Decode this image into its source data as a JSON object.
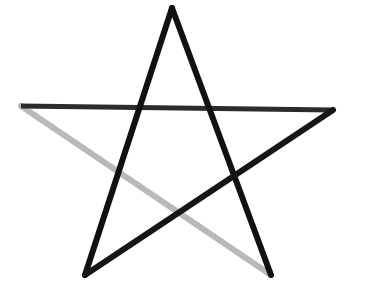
{
  "figure": {
    "name": "pentagram-star",
    "width": 365,
    "height": 296,
    "background_color": "#ffffff"
  },
  "chart_data": {
    "type": "line",
    "xlabel": "",
    "ylabel": "",
    "grid": false,
    "legend": "none",
    "xlim": [
      0,
      365
    ],
    "ylim": [
      296,
      0
    ],
    "coordinate_system": "pixels, origin top-left",
    "vertices": [
      {
        "id": "apex",
        "label": "top point",
        "x": 172,
        "y": 8
      },
      {
        "id": "right-point",
        "label": "right point",
        "x": 333,
        "y": 110
      },
      {
        "id": "bottom-left",
        "label": "bottom-left point",
        "x": 85,
        "y": 275
      },
      {
        "id": "bottom-right",
        "label": "bottom-right point",
        "x": 271,
        "y": 275
      },
      {
        "id": "left-point",
        "label": "left point",
        "x": 21,
        "y": 106
      }
    ],
    "series": [
      {
        "name": "apex-to-bottom-left",
        "from": "apex",
        "to": "bottom-left",
        "x": [
          172,
          85
        ],
        "y": [
          8,
          275
        ],
        "color": "#111111",
        "width": 6,
        "shade": "black"
      },
      {
        "name": "bottom-left-to-right-point",
        "from": "bottom-left",
        "to": "right-point",
        "x": [
          85,
          333
        ],
        "y": [
          275,
          110
        ],
        "color": "#161616",
        "width": 6,
        "shade": "black"
      },
      {
        "name": "right-point-to-left-point",
        "from": "right-point",
        "to": "left-point",
        "x": [
          333,
          21
        ],
        "y": [
          110,
          106
        ],
        "color": "#2b2b2b",
        "width": 5,
        "shade": "dark-gray"
      },
      {
        "name": "left-point-to-bottom-right",
        "from": "left-point",
        "to": "bottom-right",
        "x": [
          21,
          271
        ],
        "y": [
          106,
          275
        ],
        "color": "#b9b9b9",
        "width": 6,
        "shade": "light-gray-faded"
      },
      {
        "name": "bottom-right-to-apex",
        "from": "bottom-right",
        "to": "apex",
        "x": [
          271,
          172
        ],
        "y": [
          275,
          8
        ],
        "color": "#111111",
        "width": 6,
        "shade": "black"
      }
    ],
    "intersections": [
      {
        "id": "inner-top-left",
        "x": 128,
        "y": 141
      },
      {
        "id": "inner-top-right",
        "x": 227,
        "y": 144
      },
      {
        "id": "inner-left",
        "x": 118,
        "y": 173
      },
      {
        "id": "inner-right",
        "x": 238,
        "y": 175
      },
      {
        "id": "inner-bottom",
        "x": 178,
        "y": 210
      }
    ]
  }
}
